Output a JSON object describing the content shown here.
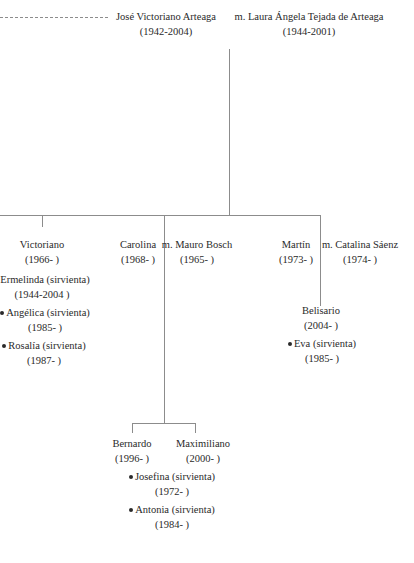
{
  "tree": {
    "root": {
      "person": {
        "name": "José Victoriano Arteaga",
        "years": "(1942-2004)"
      },
      "spouse": {
        "name": "m. Laura Ángela Tejada de Arteaga",
        "years": "(1944-2001)"
      }
    },
    "children": [
      {
        "person": {
          "name": "Victoriano",
          "years": "(1966-  )"
        },
        "servants": [
          {
            "name": "Ermelinda (sirvienta)",
            "years": "(1944-2004 )"
          },
          {
            "name": "Angélica (sirvienta)",
            "years": "(1985-  )"
          },
          {
            "name": "Rosalía (sirvienta)",
            "years": "(1987-  )"
          }
        ]
      },
      {
        "person": {
          "name": "Carolina",
          "years": "(1968-  )"
        },
        "spouse": {
          "name": "m. Mauro Bosch",
          "years": "(1965-  )"
        },
        "children": [
          {
            "name": "Bernardo",
            "years": "(1996-  )"
          },
          {
            "name": "Maximiliano",
            "years": "(2000-  )"
          }
        ],
        "servants": [
          {
            "name": "Josefina (sirvienta)",
            "years": "(1972-  )"
          },
          {
            "name": "Antonia (sirvienta)",
            "years": "(1984-  )"
          }
        ]
      },
      {
        "person": {
          "name": "Martín",
          "years": "(1973-  )"
        },
        "spouse": {
          "name": "m. Catalina Sáenz",
          "years": "(1974-  )"
        },
        "children": [
          {
            "name": "Belisario",
            "years": "(2004-  )"
          }
        ],
        "servants": [
          {
            "name": "Eva (sirvienta)",
            "years": "(1985-  )"
          }
        ]
      }
    ]
  }
}
